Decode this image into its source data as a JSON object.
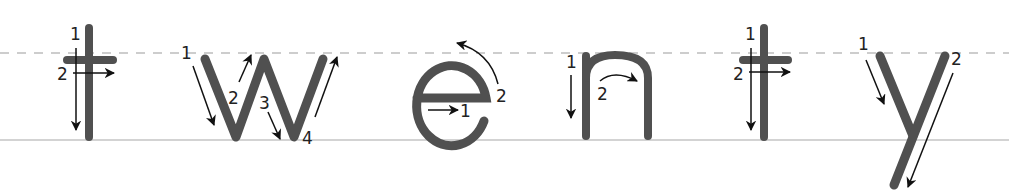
{
  "word": "twenty",
  "colors": {
    "stroke": "#505050",
    "arrow": "#111111",
    "midline": "#bdbdbd",
    "baseline": "#c4c4c4",
    "background": "#ffffff"
  },
  "guides": {
    "midline_y": 53,
    "baseline_y": 140
  },
  "letters": [
    {
      "char": "t",
      "steps": [
        "1",
        "2"
      ]
    },
    {
      "char": "w",
      "steps": [
        "1",
        "2",
        "3",
        "4"
      ]
    },
    {
      "char": "e",
      "steps": [
        "1",
        "2"
      ]
    },
    {
      "char": "n",
      "steps": [
        "1",
        "2"
      ]
    },
    {
      "char": "t",
      "steps": [
        "1",
        "2"
      ]
    },
    {
      "char": "y",
      "steps": [
        "1",
        "2"
      ]
    }
  ]
}
